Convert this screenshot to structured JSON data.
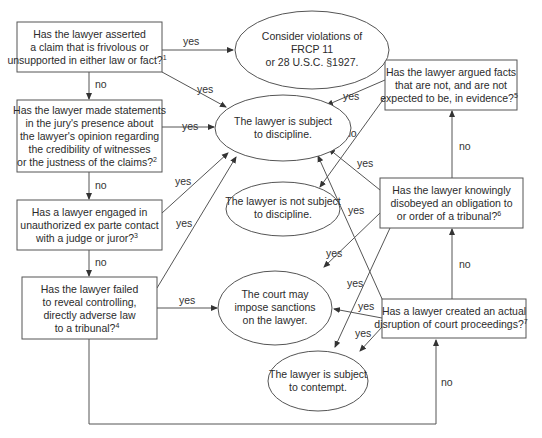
{
  "diagram": {
    "type": "flowchart",
    "title": "",
    "colors": {
      "stroke": "#555555",
      "text": "#2b2b2b",
      "background": "#ffffff"
    },
    "questions": [
      {
        "id": "q1",
        "lines": [
          "Has the lawyer asserted",
          "a claim that is frivolous or",
          "unsupported in either law or fact?"
        ],
        "footnote": "1"
      },
      {
        "id": "q2",
        "lines": [
          "Has the lawyer made statements",
          "in the jury's presence about",
          "the lawyer's opinion regarding",
          "the credibility of witnesses",
          "or the justness of the claims?"
        ],
        "footnote": "2"
      },
      {
        "id": "q3",
        "lines": [
          "Has a lawyer engaged in",
          "unauthorized ex parte contact",
          "with a judge or juror?"
        ],
        "footnote": "3"
      },
      {
        "id": "q4",
        "lines": [
          "Has the lawyer failed",
          "to reveal controlling,",
          "directly adverse law",
          "to a tribunal?"
        ],
        "footnote": "4"
      },
      {
        "id": "q5",
        "lines": [
          "Has the lawyer argued facts",
          "that are not, and are not",
          "expected to be, in evidence?"
        ],
        "footnote": "5"
      },
      {
        "id": "q6",
        "lines": [
          "Has the lawyer knowingly",
          "disobeyed an obligation to",
          "or order of a tribunal?"
        ],
        "footnote": "6"
      },
      {
        "id": "q7",
        "lines": [
          "Has a lawyer created an actual",
          "disruption of court proceedings?"
        ],
        "footnote": "7"
      }
    ],
    "outcomes": [
      {
        "id": "o1",
        "lines": [
          "Consider violations of",
          "FRCP 11",
          "or 28 U.S.C. §1927."
        ]
      },
      {
        "id": "o2",
        "lines": [
          "The lawyer is subject",
          "to discipline."
        ]
      },
      {
        "id": "o3",
        "lines": [
          "The lawyer is not subject",
          "to discipline."
        ]
      },
      {
        "id": "o4",
        "lines": [
          "The court may",
          "impose sanctions",
          "on the lawyer."
        ]
      },
      {
        "id": "o5",
        "lines": [
          "The lawyer is subject",
          "to contempt."
        ]
      }
    ],
    "edges": [
      {
        "from": "q1",
        "to": "o1",
        "label": "yes"
      },
      {
        "from": "q1",
        "to": "o2",
        "label": "yes"
      },
      {
        "from": "q1",
        "to": "q2",
        "label": "no"
      },
      {
        "from": "q2",
        "to": "o2",
        "label": "yes"
      },
      {
        "from": "q2",
        "to": "q3",
        "label": "no"
      },
      {
        "from": "q3",
        "to": "o2",
        "label": "yes"
      },
      {
        "from": "q3",
        "to": "q4",
        "label": "no"
      },
      {
        "from": "q4",
        "to": "o2",
        "label": "yes"
      },
      {
        "from": "q4",
        "to": "o4",
        "label": "yes"
      },
      {
        "from": "q4",
        "to": "q7",
        "label": "no"
      },
      {
        "from": "q5",
        "to": "o2",
        "label": "yes"
      },
      {
        "from": "q5",
        "to": "o3",
        "label": "no"
      },
      {
        "from": "q6",
        "to": "o2",
        "label": "yes"
      },
      {
        "from": "q6",
        "to": "o4",
        "label": "yes"
      },
      {
        "from": "q6",
        "to": "o5",
        "label": "yes"
      },
      {
        "from": "q6",
        "to": "q5",
        "label": "no"
      },
      {
        "from": "q7",
        "to": "o2",
        "label": "yes"
      },
      {
        "from": "q7",
        "to": "o4",
        "label": "yes"
      },
      {
        "from": "q7",
        "to": "o5",
        "label": "yes"
      },
      {
        "from": "q7",
        "to": "q6",
        "label": "no"
      }
    ],
    "labels": {
      "yes": "yes",
      "no": "no"
    }
  }
}
